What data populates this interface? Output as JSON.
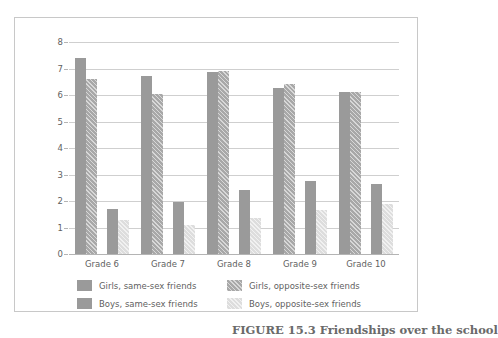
{
  "chart_data": {
    "type": "bar",
    "title": "",
    "xlabel": "",
    "ylabel": "Mean number of friends",
    "ylim": [
      0,
      8
    ],
    "yticks": [
      0,
      1,
      2,
      3,
      4,
      5,
      6,
      7,
      8
    ],
    "grid": true,
    "legend_position": "bottom",
    "categories": [
      "Grade 6",
      "Grade 7",
      "Grade 8",
      "Grade 9",
      "Grade 10"
    ],
    "series": [
      {
        "name": "Girls, same-sex friends",
        "color": "#9a9a9a",
        "pattern": "solid",
        "values": [
          7.4,
          6.7,
          6.85,
          6.25,
          6.1
        ]
      },
      {
        "name": "Girls, opposite-sex friends",
        "color": "#a8a8a8",
        "pattern": "hatched",
        "values": [
          6.6,
          6.05,
          6.9,
          6.4,
          6.1
        ]
      },
      {
        "name": "Boys, same-sex friends",
        "color": "#9a9a9a",
        "pattern": "solid",
        "values": [
          1.7,
          1.95,
          2.4,
          2.75,
          2.65
        ]
      },
      {
        "name": "Boys, opposite-sex friends",
        "color": "#dddddd",
        "pattern": "hatched",
        "values": [
          1.3,
          1.1,
          1.35,
          1.65,
          1.9
        ]
      }
    ]
  },
  "axis": {
    "y_title": "Mean number of friends",
    "y_labels": [
      "0",
      "1",
      "2",
      "3",
      "4",
      "5",
      "6",
      "7",
      "8"
    ],
    "x_labels": [
      "Grade 6",
      "Grade 7",
      "Grade 8",
      "Grade 9",
      "Grade 10"
    ]
  },
  "legend": {
    "items": [
      {
        "label": "Girls, same-sex friends",
        "swatch": "s-girls-same"
      },
      {
        "label": "Girls, opposite-sex friends",
        "swatch": "s-girls-opp"
      },
      {
        "label": "Boys, same-sex friends",
        "swatch": "s-boys-same"
      },
      {
        "label": "Boys, opposite-sex friends",
        "swatch": "s-boys-opp"
      }
    ]
  },
  "caption": {
    "text": "FIGURE 15.3  Friendships over the school"
  }
}
